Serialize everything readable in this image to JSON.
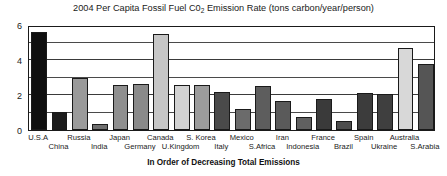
{
  "chart_data": {
    "type": "bar",
    "title_prefix": "2004 Per Capita Fossil Fuel C0",
    "title_sub": "2",
    "title_suffix": " Emission Rate (tons carbon/year/person)",
    "xlabel": "In Order of Decreasing Total Emissions",
    "ylabel": "",
    "ylim": [
      0,
      6
    ],
    "yticks": [
      0,
      2,
      4,
      6
    ],
    "ytick_labels": [
      "0",
      "2",
      "4",
      "6"
    ],
    "gridlines": [
      1,
      2,
      3,
      4,
      5
    ],
    "grid": true,
    "legend": "none",
    "categories": [
      "U.S.A",
      "China",
      "Russia",
      "India",
      "Japan",
      "Germany",
      "Canada",
      "U.Kingdom",
      "S. Korea",
      "Italy",
      "Mexico",
      "S.Africa",
      "Iran",
      "Indonesia",
      "France",
      "Brazil",
      "Spain",
      "Ukraine",
      "Australia",
      "S.Arabia"
    ],
    "values": [
      5.6,
      1.05,
      3.0,
      0.35,
      2.6,
      2.65,
      5.5,
      2.6,
      2.6,
      2.2,
      1.2,
      2.5,
      1.65,
      0.75,
      1.75,
      0.5,
      2.1,
      2.05,
      4.7,
      3.8
    ],
    "bar_colors": [
      "#0f0f0f",
      "#1c1c1c",
      "#9a9a9a",
      "#6f6f6f",
      "#8f8f8f",
      "#8a8a8a",
      "#c6c6c6",
      "#d2d2d2",
      "#9c9c9c",
      "#4a4a4a",
      "#6b6b6b",
      "#5d5d5d",
      "#5a5a5a",
      "#606060",
      "#3a3a3a",
      "#4d4d4d",
      "#3c3c3c",
      "#3f3f3f",
      "#d8d8d8",
      "#555555"
    ]
  },
  "colors": {
    "axis": "#1a1a1a",
    "grid": "#4a4a4a",
    "background": "#ffffff",
    "text": "#111111"
  }
}
